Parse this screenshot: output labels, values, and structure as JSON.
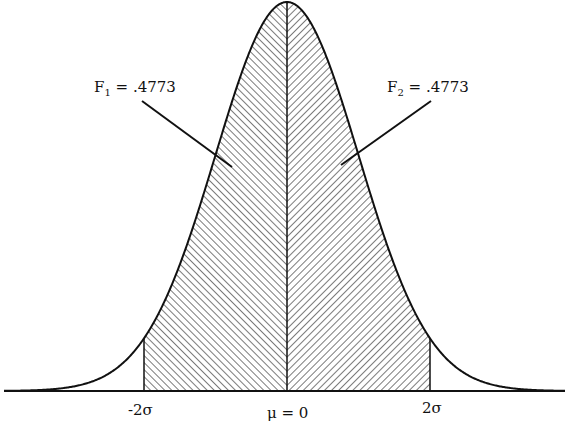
{
  "chart_data": {
    "type": "area",
    "title": "",
    "distribution": {
      "mean": 0,
      "sd": 1
    },
    "shaded_regions": [
      {
        "name": "F1",
        "from": -2,
        "to": 0,
        "area": 0.4773,
        "hatch": "back-diagonal"
      },
      {
        "name": "F2",
        "from": 0,
        "to": 2,
        "area": 0.4773,
        "hatch": "forward-diagonal"
      }
    ],
    "x_ticks": [
      -2,
      0,
      2
    ],
    "x_tick_labels": [
      "-2σ",
      "μ = 0",
      "2σ"
    ],
    "xlabel": "",
    "ylabel": "",
    "grid": false,
    "annotations": [
      {
        "label": "F1 = .4773",
        "points_to": "left shaded region"
      },
      {
        "label": "F2 = .4773",
        "points_to": "right shaded region"
      }
    ]
  },
  "labels": {
    "f1_name": "F",
    "f1_sub": "1",
    "f1_value": " = .4773",
    "f2_name": "F",
    "f2_sub": "2",
    "f2_value": " = .4773",
    "tick_neg2": "-2σ",
    "tick_mu": "μ = 0",
    "tick_pos2": "2σ"
  },
  "colors": {
    "line": "#111111",
    "hatch": "#333333",
    "background": "#ffffff"
  }
}
